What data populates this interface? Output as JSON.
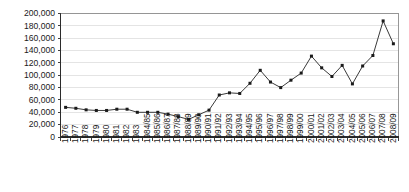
{
  "chart_data": {
    "type": "line",
    "title": "",
    "subtitle": "",
    "xlabel": "",
    "ylabel": "",
    "ylim": [
      0,
      200000
    ],
    "ytick_step": 20000,
    "grid": true,
    "legend": false,
    "legend_position": "none",
    "marker": "square",
    "line_color": "#3a3a3a",
    "marker_color": "#1a1a1a",
    "gridline_color": "#d9d9d9",
    "axis_color": "#2b2b2b",
    "plot_border_color": "#8c8c8c",
    "background_color": "#ffffff",
    "ytick_labels": [
      "200,000",
      "180,000",
      "160,000",
      "140,000",
      "120,000",
      "100,000",
      "80,000",
      "60,000",
      "40,000",
      "20,000",
      "0"
    ],
    "ytick_values": [
      200000,
      180000,
      160000,
      140000,
      120000,
      100000,
      80000,
      60000,
      40000,
      20000,
      0
    ],
    "categories": [
      "1976",
      "1977",
      "1978",
      "1979",
      "1980",
      "1981",
      "1982",
      "1983",
      "1984/85",
      "1985/86",
      "1986/87",
      "1987/88",
      "1988/89",
      "1989/90",
      "1990/91",
      "1991/92",
      "1992/93",
      "1993/94",
      "1994/95",
      "1995/96",
      "1996/97",
      "1997/98",
      "1998/99",
      "1999/00",
      "2000/01",
      "2001/02",
      "2002/03",
      "2003/04",
      "2004/05",
      "2005/06",
      "2006/07",
      "2007/08",
      "2008/09"
    ],
    "values": [
      48000,
      46500,
      44000,
      43000,
      43000,
      45000,
      45000,
      40000,
      40000,
      40000,
      37000,
      33000,
      28500,
      36000,
      43500,
      68000,
      71500,
      70500,
      87000,
      108000,
      89000,
      80000,
      92000,
      103500,
      131000,
      112000,
      98000,
      116000,
      86000,
      115000,
      132000,
      188000,
      151000
    ]
  }
}
